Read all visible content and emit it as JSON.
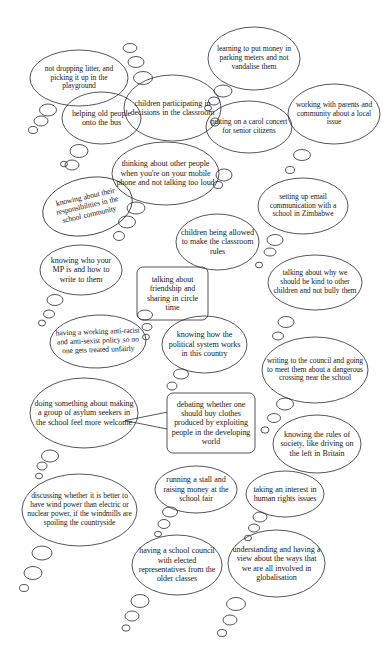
{
  "document": {
    "type": "thought-bubble-diagram",
    "title": "Citizenship ideas thought bubbles",
    "background_color": "#ffffff",
    "ink_color": "#1b1b22",
    "width": 388,
    "height": 669
  },
  "bubbles": [
    {
      "id": "not-dropping-litter",
      "shape": "ellipse",
      "text": "not dropping litter, and picking it up in the playground",
      "x": 30,
      "y": 50,
      "w": 98,
      "h": 56,
      "rotate": 0,
      "size": "s75"
    },
    {
      "id": "learning-parking-meters",
      "shape": "ellipse",
      "text": "learning to put money in parking meters and not vandalise them",
      "x": 208,
      "y": 27,
      "w": 92,
      "h": 63,
      "rotate": 0,
      "size": "s75"
    },
    {
      "id": "children-participating-decisions",
      "shape": "ellipse",
      "text": "children participating in decisions in the classroom",
      "x": 124,
      "y": 75,
      "w": 97,
      "h": 66,
      "rotate": 0,
      "size": "s8"
    },
    {
      "id": "helping-old-people-bus",
      "shape": "ellipse",
      "text": "helping old people onto the bus",
      "x": 62,
      "y": 92,
      "w": 79,
      "h": 52,
      "rotate": 0,
      "size": "s8"
    },
    {
      "id": "putting-on-carol-concert",
      "shape": "ellipse",
      "text": "putting on a carol concert for senior citizens",
      "x": 206,
      "y": 101,
      "w": 86,
      "h": 52,
      "rotate": 0,
      "size": "s75"
    },
    {
      "id": "working-with-parents-community",
      "shape": "ellipse",
      "text": "working with parents and community about a local issue",
      "x": 288,
      "y": 84,
      "w": 92,
      "h": 60,
      "rotate": 0,
      "size": "s75"
    },
    {
      "id": "thinking-about-other-people",
      "shape": "ellipse",
      "text": "thinking about other people when you're on your mobile phone and not talking too loud",
      "x": 112,
      "y": 142,
      "w": 107,
      "h": 63,
      "rotate": 0,
      "size": "s8"
    },
    {
      "id": "knowing-responsibilities-school-community",
      "shape": "ellipse",
      "text": "knowing about their responsibilities in the school community",
      "x": 42,
      "y": 178,
      "w": 91,
      "h": 57,
      "rotate": -13,
      "size": "s75"
    },
    {
      "id": "setting-up-email-zimbabwe",
      "shape": "ellipse",
      "text": "setting up email communication with a school in Zimbabwe",
      "x": 258,
      "y": 178,
      "w": 90,
      "h": 56,
      "rotate": 0,
      "size": "s75"
    },
    {
      "id": "children-allowed-classroom-rules",
      "shape": "ellipse",
      "text": "children being allowed to make the classroom rules",
      "x": 176,
      "y": 214,
      "w": 83,
      "h": 56,
      "rotate": 0,
      "size": "s8"
    },
    {
      "id": "knowing-who-your-mp-is",
      "shape": "ellipse",
      "text": "knowing who your MP is and how to write to them",
      "x": 40,
      "y": 245,
      "w": 82,
      "h": 50,
      "rotate": 0,
      "size": "s8"
    },
    {
      "id": "talking-about-friendship-circle-time",
      "shape": "rounded-rect",
      "text": "talking about friendship and sharing in circle time",
      "x": 137,
      "y": 267,
      "w": 71,
      "h": 53,
      "rotate": 0,
      "size": "s8"
    },
    {
      "id": "talking-why-be-kind",
      "shape": "ellipse",
      "text": "talking about why we should be kind to other children and not bully them",
      "x": 268,
      "y": 255,
      "w": 94,
      "h": 55,
      "rotate": 0,
      "size": "s75"
    },
    {
      "id": "anti-racist-anti-sexist-policy",
      "shape": "ellipse",
      "text": "having a working anti-racist and anti-sexist policy so no one gets treated unfairly",
      "x": 50,
      "y": 315,
      "w": 96,
      "h": 53,
      "rotate": -2,
      "size": "s75"
    },
    {
      "id": "knowing-political-system",
      "shape": "ellipse",
      "text": "knowing how the political system works in this country",
      "x": 162,
      "y": 316,
      "w": 85,
      "h": 57,
      "rotate": 0,
      "size": "s8"
    },
    {
      "id": "writing-to-council-crossing",
      "shape": "ellipse",
      "text": "writing to the council and going to meet them about a dangerous crossing near the school",
      "x": 262,
      "y": 337,
      "w": 106,
      "h": 66,
      "rotate": 0,
      "size": "s75"
    },
    {
      "id": "asylum-seekers-welcome",
      "shape": "ellipse",
      "text": "doing something about making a group of asylum seekers in the school feel more welcome",
      "x": 30,
      "y": 378,
      "w": 108,
      "h": 70,
      "rotate": 0,
      "size": "s8"
    },
    {
      "id": "debating-buying-clothes",
      "shape": "rounded-rect-pointer",
      "text": "debating whether one should buy clothes produced by exploiting people in the developing world",
      "x": 167,
      "y": 393,
      "w": 88,
      "h": 60,
      "rotate": 0,
      "size": "s8"
    },
    {
      "id": "knowing-rules-of-society",
      "shape": "ellipse",
      "text": "knowing the rules of society, like driving on the left in Britain",
      "x": 273,
      "y": 415,
      "w": 88,
      "h": 58,
      "rotate": 0,
      "size": "s8"
    },
    {
      "id": "running-a-stall-school-fair",
      "shape": "ellipse",
      "text": "running a stall and raising money at the school fair",
      "x": 155,
      "y": 466,
      "w": 82,
      "h": 47,
      "rotate": 0,
      "size": "s8"
    },
    {
      "id": "taking-interest-human-rights",
      "shape": "ellipse",
      "text": "taking an interest in human rights issues",
      "x": 246,
      "y": 471,
      "w": 78,
      "h": 46,
      "rotate": 0,
      "size": "s8"
    },
    {
      "id": "wind-power-countryside",
      "shape": "ellipse",
      "text": "discussing whether it is better to have wind power than electric or nuclear power, if the windmills are spoiling the countryside",
      "x": 22,
      "y": 474,
      "w": 115,
      "h": 72,
      "rotate": 0,
      "size": "s75"
    },
    {
      "id": "school-council-elected-reps",
      "shape": "ellipse",
      "text": "having a school council with elected representatives from the older classes",
      "x": 132,
      "y": 535,
      "w": 90,
      "h": 60,
      "rotate": 0,
      "size": "s8"
    },
    {
      "id": "understanding-globalisation",
      "shape": "ellipse",
      "text": "understanding and having a view about the ways that we are all involved in globalisation",
      "x": 228,
      "y": 530,
      "w": 97,
      "h": 67,
      "rotate": 0,
      "size": "s8"
    }
  ],
  "tail_circles": [
    {
      "cx": 130,
      "cy": 48,
      "rx": 7,
      "ry": 4.5
    },
    {
      "cx": 136,
      "cy": 62,
      "rx": 8,
      "ry": 5.5
    },
    {
      "cx": 143,
      "cy": 78,
      "rx": 9.5,
      "ry": 6.5
    },
    {
      "cx": 48,
      "cy": 110,
      "rx": 8.5,
      "ry": 6
    },
    {
      "cx": 41,
      "cy": 121,
      "rx": 7,
      "ry": 5
    },
    {
      "cx": 33,
      "cy": 130,
      "rx": 4.5,
      "ry": 3.5
    },
    {
      "cx": 223,
      "cy": 91,
      "rx": 9,
      "ry": 6
    },
    {
      "cx": 214,
      "cy": 101,
      "rx": 5.5,
      "ry": 4
    },
    {
      "cx": 208,
      "cy": 108,
      "rx": 3.5,
      "ry": 2.8
    },
    {
      "cx": 215,
      "cy": 122,
      "rx": 4.5,
      "ry": 4
    },
    {
      "cx": 79,
      "cy": 151,
      "rx": 9,
      "ry": 6.5
    },
    {
      "cx": 72,
      "cy": 165,
      "rx": 7,
      "ry": 5
    },
    {
      "cx": 64,
      "cy": 164,
      "rx": 3.5,
      "ry": 2.8
    },
    {
      "cx": 302,
      "cy": 155,
      "rx": 8.5,
      "ry": 5.5
    },
    {
      "cx": 290,
      "cy": 170,
      "rx": 4.5,
      "ry": 3.5
    },
    {
      "cx": 224,
      "cy": 175,
      "rx": 8,
      "ry": 6
    },
    {
      "cx": 218,
      "cy": 185,
      "rx": 4.5,
      "ry": 3.5
    },
    {
      "cx": 136,
      "cy": 208,
      "rx": 9,
      "ry": 6
    },
    {
      "cx": 127,
      "cy": 222,
      "rx": 8.5,
      "ry": 6
    },
    {
      "cx": 119,
      "cy": 236,
      "rx": 5.5,
      "ry": 4.5
    },
    {
      "cx": 275,
      "cy": 240,
      "rx": 8,
      "ry": 5.5
    },
    {
      "cx": 270,
      "cy": 252,
      "rx": 6,
      "ry": 4
    },
    {
      "cx": 259,
      "cy": 265,
      "rx": 3.5,
      "ry": 2.8
    },
    {
      "cx": 55,
      "cy": 300,
      "rx": 8,
      "ry": 5.5
    },
    {
      "cx": 49,
      "cy": 314,
      "rx": 5.5,
      "ry": 4
    },
    {
      "cx": 42,
      "cy": 323,
      "rx": 3.5,
      "ry": 3
    },
    {
      "cx": 286,
      "cy": 322,
      "rx": 8,
      "ry": 5.5
    },
    {
      "cx": 278,
      "cy": 336,
      "rx": 5.5,
      "ry": 4
    },
    {
      "cx": 145,
      "cy": 315,
      "rx": 7.5,
      "ry": 5
    },
    {
      "cx": 147,
      "cy": 327,
      "rx": 5,
      "ry": 3.5
    },
    {
      "cx": 146,
      "cy": 337,
      "rx": 3.5,
      "ry": 2.8
    },
    {
      "cx": 181,
      "cy": 374,
      "rx": 7.5,
      "ry": 5
    },
    {
      "cx": 172,
      "cy": 386,
      "rx": 5,
      "ry": 4
    },
    {
      "cx": 285,
      "cy": 404,
      "rx": 8.5,
      "ry": 6
    },
    {
      "cx": 274,
      "cy": 418,
      "rx": 6.5,
      "ry": 4.5
    },
    {
      "cx": 265,
      "cy": 430,
      "rx": 4,
      "ry": 3.2
    },
    {
      "cx": 50,
      "cy": 456,
      "rx": 8.5,
      "ry": 6
    },
    {
      "cx": 42,
      "cy": 466,
      "rx": 5,
      "ry": 4
    },
    {
      "cx": 39,
      "cy": 476,
      "rx": 3.5,
      "ry": 2.8
    },
    {
      "cx": 170,
      "cy": 512,
      "rx": 7.5,
      "ry": 5
    },
    {
      "cx": 164,
      "cy": 524,
      "rx": 6,
      "ry": 4.5
    },
    {
      "cx": 158,
      "cy": 534,
      "rx": 3.5,
      "ry": 2.8
    },
    {
      "cx": 260,
      "cy": 517,
      "rx": 7,
      "ry": 5
    },
    {
      "cx": 254,
      "cy": 528,
      "rx": 5.5,
      "ry": 4
    },
    {
      "cx": 248,
      "cy": 538,
      "rx": 3.5,
      "ry": 2.8
    },
    {
      "cx": 42,
      "cy": 553,
      "rx": 10,
      "ry": 7
    },
    {
      "cx": 33,
      "cy": 573,
      "rx": 9,
      "ry": 6.5
    },
    {
      "cx": 24,
      "cy": 588,
      "rx": 4.5,
      "ry": 3.5
    },
    {
      "cx": 140,
      "cy": 601,
      "rx": 9,
      "ry": 6.5
    },
    {
      "cx": 132,
      "cy": 616,
      "rx": 7,
      "ry": 5
    },
    {
      "cx": 126,
      "cy": 628,
      "rx": 4,
      "ry": 3.2
    },
    {
      "cx": 236,
      "cy": 604,
      "rx": 9.5,
      "ry": 6.5
    },
    {
      "cx": 230,
      "cy": 620,
      "rx": 7,
      "ry": 5
    },
    {
      "cx": 222,
      "cy": 633,
      "rx": 4.5,
      "ry": 3.5
    }
  ]
}
